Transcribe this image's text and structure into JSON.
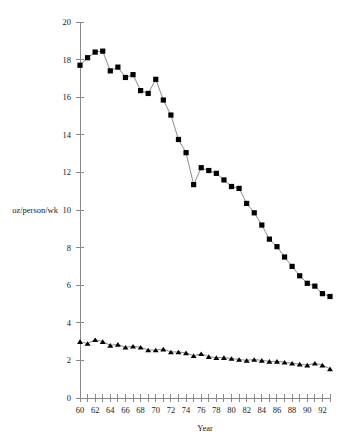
{
  "chart_data": {
    "type": "line",
    "title": "",
    "xlabel": "Year",
    "ylabel": "oz/person/wk",
    "xlim": [
      60,
      93
    ],
    "ylim": [
      0,
      20
    ],
    "x_tick_step": 1,
    "x_label_step": 2,
    "y_tick_step": 2,
    "grid": false,
    "legend_position": "none",
    "x_tick_labels": [
      "60",
      "62",
      "64",
      "66",
      "68",
      "70",
      "72",
      "74",
      "76",
      "78",
      "80",
      "82",
      "84",
      "86",
      "88",
      "90",
      "92"
    ],
    "y_tick_labels": [
      "0",
      "2",
      "4",
      "6",
      "8",
      "10",
      "12",
      "14",
      "16",
      "18",
      "20"
    ],
    "x": [
      60,
      61,
      62,
      63,
      64,
      65,
      66,
      67,
      68,
      69,
      70,
      71,
      72,
      73,
      74,
      75,
      76,
      77,
      78,
      79,
      80,
      81,
      82,
      83,
      84,
      85,
      86,
      87,
      88,
      89,
      90,
      91,
      92,
      93
    ],
    "series": [
      {
        "name": "series-squares",
        "marker": "square",
        "values": [
          17.7,
          18.1,
          18.4,
          18.45,
          17.4,
          17.6,
          17.05,
          17.2,
          16.35,
          16.2,
          16.95,
          15.85,
          15.05,
          13.75,
          13.05,
          11.35,
          12.25,
          12.1,
          11.95,
          11.6,
          11.25,
          11.15,
          10.35,
          9.85,
          9.2,
          8.45,
          8.05,
          7.5,
          7.0,
          6.5,
          6.1,
          5.95,
          5.55,
          5.4
        ]
      },
      {
        "name": "series-triangles",
        "marker": "triangle",
        "values": [
          3.0,
          2.9,
          3.1,
          3.0,
          2.8,
          2.85,
          2.7,
          2.75,
          2.7,
          2.55,
          2.55,
          2.6,
          2.45,
          2.45,
          2.4,
          2.25,
          2.35,
          2.2,
          2.15,
          2.15,
          2.1,
          2.05,
          2.0,
          2.05,
          2.0,
          1.95,
          1.95,
          1.9,
          1.85,
          1.8,
          1.75,
          1.85,
          1.75,
          1.55
        ]
      }
    ],
    "colors": {
      "marker": "#000000",
      "line": "#5a5a5a",
      "axis": "#8a8a8a",
      "text": "#1a1a1a",
      "background": "#ffffff"
    }
  }
}
